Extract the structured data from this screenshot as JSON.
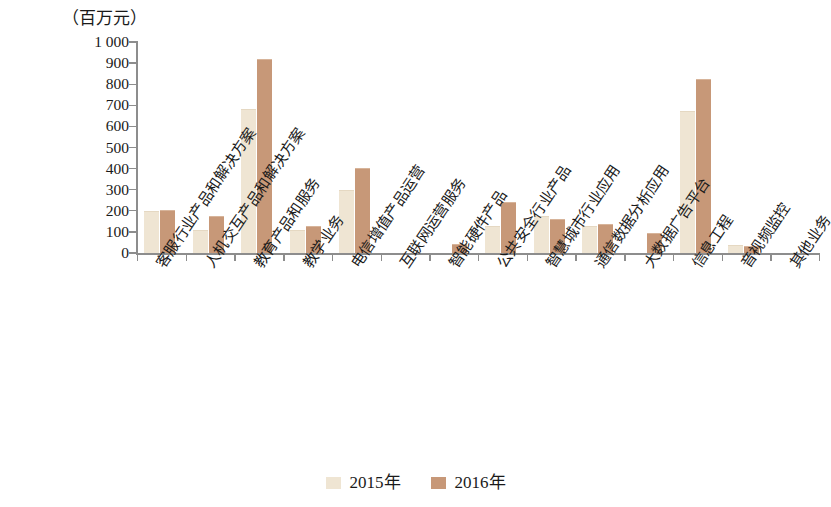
{
  "chart_data": {
    "type": "bar",
    "title": "",
    "subtitle": "",
    "unit_label": "（百万元）",
    "xlabel": "",
    "ylabel": "",
    "ylim": [
      0,
      1000
    ],
    "ytick_step": 100,
    "grid": false,
    "legend_position": "bottom-center",
    "ytick_labels": [
      "1 000",
      "900",
      "800",
      "700",
      "600",
      "500",
      "400",
      "300",
      "200",
      "100",
      "0"
    ],
    "ytick_values": [
      1000,
      900,
      800,
      700,
      600,
      500,
      400,
      300,
      200,
      100,
      0
    ],
    "categories": [
      "客服行业产品和解决方案",
      "人机交互产品和解决方案",
      "教育产品和服务",
      "教学业务",
      "电信增值产品运营",
      "互联网运营服务",
      "智能硬件产品",
      "公共安全行业产品",
      "智慧城市行业应用",
      "通信数据分析应用",
      "大数据广告平台",
      "信息工程",
      "音视频监控",
      "其他业务"
    ],
    "series": [
      {
        "name": "2015年",
        "color": "#efe5d3",
        "values": [
          195,
          105,
          680,
          105,
          295,
          0,
          0,
          125,
          170,
          125,
          0,
          670,
          35,
          0
        ]
      },
      {
        "name": "2016年",
        "color": "#c79878",
        "values": [
          200,
          170,
          915,
          125,
          400,
          0,
          40,
          235,
          155,
          135,
          90,
          820,
          30,
          0
        ]
      }
    ]
  },
  "legend": {
    "items": [
      {
        "label": "2015年",
        "color": "#efe5d3"
      },
      {
        "label": "2016年",
        "color": "#c79878"
      }
    ]
  }
}
